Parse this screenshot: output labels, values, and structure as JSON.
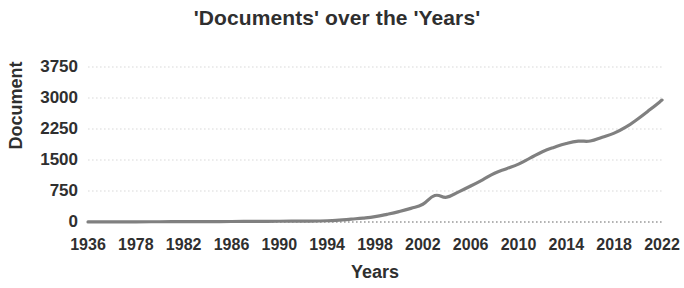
{
  "chart_data": {
    "type": "line",
    "title": "'Documents' over the 'Years'",
    "xlabel": "Years",
    "ylabel": "Document",
    "ylim": [
      0,
      3750
    ],
    "yticks": [
      0,
      750,
      1500,
      2250,
      3000,
      3750
    ],
    "ytick_labels": [
      "0",
      "750",
      "1500",
      "2250",
      "3000",
      "3750"
    ],
    "xtick_labels": [
      "1936",
      "1978",
      "1982",
      "1986",
      "1990",
      "1994",
      "1998",
      "2002",
      "2006",
      "2010",
      "2014",
      "2018",
      "2022"
    ],
    "xlim": [
      1936,
      2022
    ],
    "grid": "horizontal-dotted",
    "legend": "none",
    "line_color": "#808080",
    "grid_color": "#d9d9d9",
    "x": [
      1936,
      1978,
      1980,
      1982,
      1984,
      1986,
      1988,
      1990,
      1992,
      1994,
      1995,
      1996,
      1997,
      1998,
      1999,
      2000,
      2001,
      2002,
      2003,
      2004,
      2005,
      2006,
      2007,
      2008,
      2009,
      2010,
      2011,
      2012,
      2013,
      2014,
      2015,
      2016,
      2017,
      2018,
      2019,
      2020,
      2021,
      2022
    ],
    "values": [
      2,
      5,
      6,
      8,
      10,
      12,
      15,
      18,
      22,
      30,
      45,
      70,
      95,
      130,
      185,
      250,
      330,
      430,
      640,
      600,
      730,
      870,
      1020,
      1180,
      1290,
      1400,
      1550,
      1700,
      1810,
      1900,
      1955,
      1960,
      2050,
      2150,
      2300,
      2500,
      2720,
      2950
    ],
    "series_name": "Documents"
  }
}
